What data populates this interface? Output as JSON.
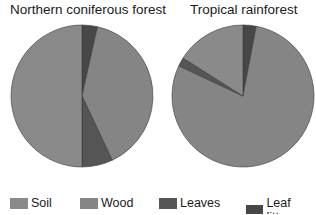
{
  "chart_data": [
    {
      "type": "pie",
      "title": "Northern coniferous forest",
      "categories": [
        "Leaf litter",
        "Wood",
        "Leaves",
        "Soil"
      ],
      "values": [
        3.5,
        39.5,
        7,
        50
      ],
      "unit": "percent",
      "start": "12 o'clock",
      "direction": "clockwise"
    },
    {
      "type": "pie",
      "title": "Tropical rainforest",
      "categories": [
        "Leaf litter",
        "Wood",
        "Leaves",
        "Soil"
      ],
      "values": [
        3,
        79,
        2,
        16
      ],
      "unit": "percent",
      "start": "12 o'clock",
      "direction": "clockwise"
    }
  ],
  "legend": {
    "placement": "bottom",
    "items": [
      {
        "label": "Soil",
        "color": "#8a8a8a"
      },
      {
        "label": "Wood",
        "color": "#858585"
      },
      {
        "label": "Leaves",
        "color": "#555555"
      },
      {
        "label": "Leaf litter",
        "color": "#474747"
      }
    ]
  },
  "colors": {
    "Soil": "#8a8a8a",
    "Wood": "#858585",
    "Leaves": "#555555",
    "Leaf litter": "#474747"
  }
}
